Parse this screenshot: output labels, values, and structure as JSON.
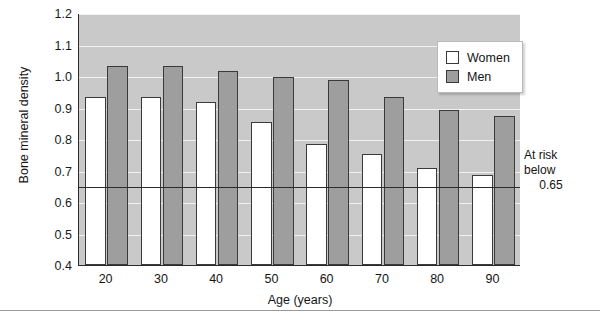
{
  "chart_data": {
    "type": "bar",
    "title": "",
    "xlabel": "Age (years)",
    "ylabel": "Bone mineral density",
    "categories": [
      "20",
      "30",
      "40",
      "50",
      "60",
      "70",
      "80",
      "90"
    ],
    "series": [
      {
        "name": "Women",
        "color": "#ffffff",
        "values": [
          0.935,
          0.935,
          0.917,
          0.855,
          0.783,
          0.753,
          0.707,
          0.687
        ]
      },
      {
        "name": "Men",
        "color": "#9e9e9e",
        "values": [
          1.032,
          1.032,
          1.017,
          0.997,
          0.988,
          0.935,
          0.893,
          0.873
        ]
      }
    ],
    "ylim": [
      0.4,
      1.2
    ],
    "ytick_labels": [
      "1.2",
      "1.1",
      "1.0",
      "0.9",
      "0.8",
      "0.7",
      "0.6",
      "0.5",
      "0.4"
    ],
    "ytick_values": [
      1.2,
      1.1,
      1.0,
      0.9,
      0.8,
      0.7,
      0.6,
      0.5,
      0.4
    ],
    "grid": true,
    "legend_position": "top-right",
    "threshold": {
      "value": 0.65,
      "annotation_line1": "At risk",
      "annotation_line2": "below",
      "annotation_line3": "0.65"
    },
    "plot_background": "#c9c9c9",
    "gridline_color": "#f2f2f2",
    "axis_color": "#2b2b2b"
  },
  "legend": {
    "items": [
      {
        "label": "Women"
      },
      {
        "label": "Men"
      }
    ]
  }
}
